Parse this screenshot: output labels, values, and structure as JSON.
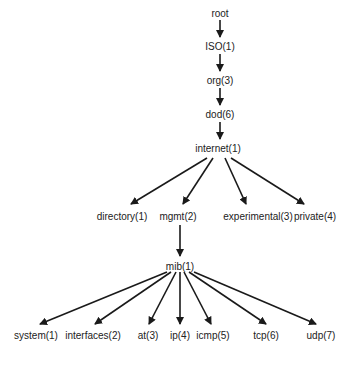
{
  "diagram": {
    "type": "tree",
    "edge_color": "#1a1a1a",
    "nodes": [
      {
        "id": "root",
        "label": "root",
        "x": 220,
        "y": 8
      },
      {
        "id": "iso",
        "label": "ISO(1)",
        "x": 220,
        "y": 41
      },
      {
        "id": "org",
        "label": "org(3)",
        "x": 220,
        "y": 75
      },
      {
        "id": "dod",
        "label": "dod(6)",
        "x": 220,
        "y": 109
      },
      {
        "id": "internet",
        "label": "internet(1)",
        "x": 218,
        "y": 143
      },
      {
        "id": "directory",
        "label": "directory(1)",
        "x": 122,
        "y": 211
      },
      {
        "id": "mgmt",
        "label": "mgmt(2)",
        "x": 178,
        "y": 211
      },
      {
        "id": "experimental",
        "label": "experimental(3)",
        "x": 258,
        "y": 211
      },
      {
        "id": "private",
        "label": "private(4)",
        "x": 315,
        "y": 211
      },
      {
        "id": "mib",
        "label": "mib(1)",
        "x": 180,
        "y": 261
      },
      {
        "id": "system",
        "label": "system(1)",
        "x": 36,
        "y": 330
      },
      {
        "id": "interfaces",
        "label": "interfaces(2)",
        "x": 93,
        "y": 330
      },
      {
        "id": "at",
        "label": "at(3)",
        "x": 148,
        "y": 330
      },
      {
        "id": "ip",
        "label": "ip(4)",
        "x": 180,
        "y": 330
      },
      {
        "id": "icmp",
        "label": "icmp(5)",
        "x": 213,
        "y": 330
      },
      {
        "id": "tcp",
        "label": "tcp(6)",
        "x": 266,
        "y": 330
      },
      {
        "id": "udp",
        "label": "udp(7)",
        "x": 321,
        "y": 330
      }
    ],
    "edges": [
      {
        "x1": 220,
        "y1": 20,
        "x2": 220,
        "y2": 37
      },
      {
        "x1": 220,
        "y1": 54,
        "x2": 220,
        "y2": 71
      },
      {
        "x1": 220,
        "y1": 88,
        "x2": 220,
        "y2": 105
      },
      {
        "x1": 220,
        "y1": 122,
        "x2": 220,
        "y2": 139
      },
      {
        "x1": 207,
        "y1": 158,
        "x2": 131,
        "y2": 204
      },
      {
        "x1": 213,
        "y1": 158,
        "x2": 183,
        "y2": 204
      },
      {
        "x1": 225,
        "y1": 158,
        "x2": 246,
        "y2": 204
      },
      {
        "x1": 231,
        "y1": 158,
        "x2": 304,
        "y2": 204
      },
      {
        "x1": 180,
        "y1": 225,
        "x2": 180,
        "y2": 256
      },
      {
        "x1": 167,
        "y1": 272,
        "x2": 40,
        "y2": 324
      },
      {
        "x1": 171,
        "y1": 272,
        "x2": 95,
        "y2": 324
      },
      {
        "x1": 176,
        "y1": 272,
        "x2": 149,
        "y2": 324
      },
      {
        "x1": 180,
        "y1": 272,
        "x2": 180,
        "y2": 324
      },
      {
        "x1": 184,
        "y1": 272,
        "x2": 211,
        "y2": 324
      },
      {
        "x1": 189,
        "y1": 272,
        "x2": 266,
        "y2": 324
      },
      {
        "x1": 194,
        "y1": 272,
        "x2": 316,
        "y2": 324
      }
    ]
  }
}
